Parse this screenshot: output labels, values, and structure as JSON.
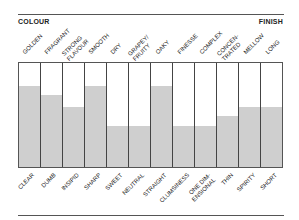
{
  "header": {
    "left_label": "COLOUR",
    "right_label": "FINISH"
  },
  "chart_data": {
    "type": "bar",
    "title": "",
    "xlabel": "",
    "ylabel": "",
    "ylim": [
      0,
      1
    ],
    "grid": false,
    "legend": null,
    "top_labels": [
      "GOLDEN",
      "FRAGRANT",
      "STRONG FLAVOUR",
      "SMOOTH",
      "DRY",
      "GRAPEY/ FRUITY",
      "OAKY",
      "FINESSE",
      "COMPLEX",
      "CONCEN- TRATED",
      "MELLOW",
      "LONG"
    ],
    "categories": [
      "CLEAR",
      "DUMB",
      "INSIPID",
      "SHARP",
      "SWEET",
      "NEUTRAL",
      "STRAIGHT",
      "CLUMSINESS",
      "ONE DIM- ENSIONAL",
      "THIN",
      "SPIRITY",
      "SHORT"
    ],
    "values": [
      0.78,
      0.69,
      0.58,
      0.78,
      0.39,
      0.39,
      0.78,
      0.39,
      0.39,
      0.49,
      0.58,
      0.58
    ],
    "annotations": [
      "COLOUR",
      "FINISH"
    ]
  },
  "colors": {
    "fill": "#cfcfcf",
    "lines": "#444444"
  }
}
